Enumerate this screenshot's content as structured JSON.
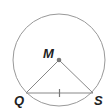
{
  "diagram": {
    "type": "geometry",
    "circle": {
      "center": "M",
      "stroke": "#999999"
    },
    "points": [
      {
        "name": "M",
        "label": "M",
        "role": "center"
      },
      {
        "name": "Q",
        "label": "Q",
        "role": "on-circle"
      },
      {
        "name": "S",
        "label": "S",
        "role": "on-circle"
      }
    ],
    "segments": [
      {
        "from": "M",
        "to": "Q"
      },
      {
        "from": "M",
        "to": "S"
      },
      {
        "from": "Q",
        "to": "S",
        "tick_marks": 1
      }
    ],
    "colors": {
      "line": "#888888",
      "center_dot": "#777777",
      "label": "#222222"
    }
  }
}
